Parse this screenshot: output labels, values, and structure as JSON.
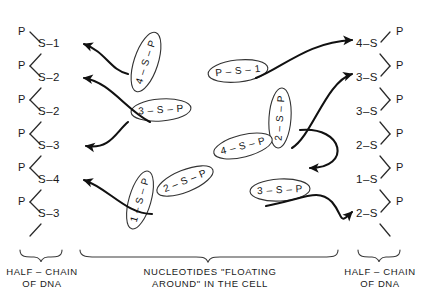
{
  "figure": {
    "background": "#ffffff",
    "ink": "#1a1a1a"
  },
  "left_chain": {
    "caption_line1": "HALF – CHAIN",
    "caption_line2": "OF DNA",
    "p_label": "P",
    "units": [
      {
        "p": "P",
        "s": "S",
        "dash": "–",
        "base": "1"
      },
      {
        "p": "P",
        "s": "S",
        "dash": "–",
        "base": "2"
      },
      {
        "p": "P",
        "s": "S",
        "dash": "–",
        "base": "2"
      },
      {
        "p": "P",
        "s": "S",
        "dash": "–",
        "base": "3"
      },
      {
        "p": "P",
        "s": "S",
        "dash": "–",
        "base": "4"
      },
      {
        "p": "P",
        "s": "S",
        "dash": "–",
        "base": "3"
      }
    ]
  },
  "right_chain": {
    "caption_line1": "HALF – CHAIN",
    "caption_line2": "OF DNA",
    "p_label": "P",
    "units": [
      {
        "base": "4",
        "dash": "–",
        "s": "S",
        "p": "P"
      },
      {
        "base": "3",
        "dash": "–",
        "s": "S",
        "p": "P"
      },
      {
        "base": "3",
        "dash": "–",
        "s": "S",
        "p": "P"
      },
      {
        "base": "2",
        "dash": "–",
        "s": "S",
        "p": "P"
      },
      {
        "base": "1",
        "dash": "–",
        "s": "S",
        "p": "P"
      },
      {
        "base": "2",
        "dash": "–",
        "s": "S",
        "p": "P"
      }
    ]
  },
  "middle": {
    "caption_line1": "NUCLEOTIDES \"FLOATING",
    "caption_line2": "AROUND\" IN THE CELL",
    "nucleotides": [
      {
        "id": "nuc-4-s-p-upper-left",
        "text": "4 – S – P",
        "x": 146,
        "y": 62,
        "rot": -72
      },
      {
        "id": "nuc-3-s-p-upper-mid",
        "text": "3 – S – P",
        "x": 161,
        "y": 110,
        "rot": -4
      },
      {
        "id": "nuc-p-s-1",
        "text": "P – S – 1",
        "x": 238,
        "y": 71,
        "rot": -6
      },
      {
        "id": "nuc-2-s-p-right",
        "text": "2 – S – P",
        "x": 280,
        "y": 118,
        "rot": -86
      },
      {
        "id": "nuc-4-s-p-lower-mid",
        "text": "4 – S – P",
        "x": 243,
        "y": 146,
        "rot": -14
      },
      {
        "id": "nuc-2-s-p-center",
        "text": "2 – S – P",
        "x": 185,
        "y": 181,
        "rot": -22
      },
      {
        "id": "nuc-1-s-p-lower-left",
        "text": "1 – S – P",
        "x": 140,
        "y": 200,
        "rot": -74
      },
      {
        "id": "nuc-3-s-p-lower-right",
        "text": "3 – S – P",
        "x": 280,
        "y": 190,
        "rot": -3
      }
    ],
    "arrow_count": 7
  }
}
